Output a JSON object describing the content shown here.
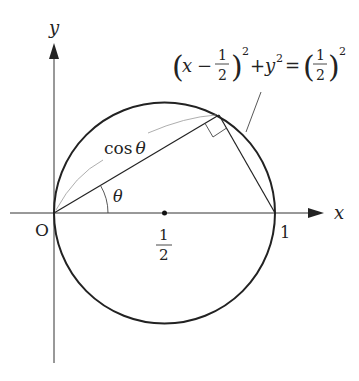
{
  "axes": {
    "x_label": "x",
    "y_label": "y",
    "origin_label": "O"
  },
  "ticks": {
    "one": "1",
    "half_num": "1",
    "half_den": "2"
  },
  "labels": {
    "cos": "cos",
    "theta": "θ"
  },
  "equation": {
    "lparen": "(",
    "x": "x",
    "minus": "−",
    "frac1_num": "1",
    "frac1_den": "2",
    "rparen": ")",
    "sq": "2",
    "plus": "+",
    "y": "y",
    "eq": "=",
    "frac2_num": "1",
    "frac2_den": "2"
  },
  "colors": {
    "stroke": "#222222",
    "guide": "#888888"
  }
}
